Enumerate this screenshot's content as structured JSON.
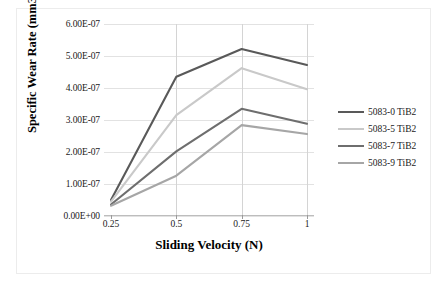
{
  "chart_data": {
    "type": "line",
    "title": "",
    "xlabel": "Sliding Velocity (N)",
    "ylabel": "Specific Wear Rate (mm3/Nm)",
    "categories": [
      "0.25",
      "0.5",
      "0.75",
      "1"
    ],
    "x": [
      0.25,
      0.5,
      0.75,
      1
    ],
    "ylim": [
      0,
      6e-07
    ],
    "ytick_labels": [
      "0.00E+00",
      "1.00E-07",
      "2.00E-07",
      "3.00E-07",
      "4.00E-07",
      "5.00E-07",
      "6.00E-07"
    ],
    "ytick_values": [
      0,
      1e-07,
      2e-07,
      3e-07,
      4e-07,
      5e-07,
      6e-07
    ],
    "grid": "horizontal-and-vertical",
    "legend_position": "right",
    "series": [
      {
        "name": "5083-0 TiB2",
        "color": "#595959",
        "values": [
          5e-08,
          4.35e-07,
          5.22e-07,
          4.72e-07
        ]
      },
      {
        "name": "5083-5 TiB2",
        "color": "#c9c9c9",
        "values": [
          4.5e-08,
          3.15e-07,
          4.62e-07,
          3.96e-07
        ]
      },
      {
        "name": "5083-7 TiB2",
        "color": "#6e6e6e",
        "values": [
          3.6e-08,
          2.02e-07,
          3.35e-07,
          2.88e-07
        ]
      },
      {
        "name": "5083-9 TiB2",
        "color": "#a6a6a6",
        "values": [
          3.2e-08,
          1.26e-07,
          2.84e-07,
          2.56e-07
        ]
      }
    ]
  },
  "legend": {
    "items": [
      {
        "label": "5083-0 TiB2"
      },
      {
        "label": "5083-5 TiB2"
      },
      {
        "label": "5083-7 TiB2"
      },
      {
        "label": "5083-9 TiB2"
      }
    ]
  },
  "axes": {
    "x_title": "Sliding Velocity (N)",
    "y_title": "Specific Wear Rate (mm3/Nm)"
  }
}
